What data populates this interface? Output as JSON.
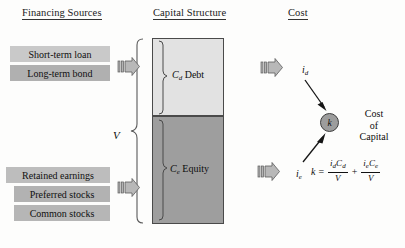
{
  "headers": {
    "financing": "Financing Sources",
    "capital": "Capital Structure",
    "cost": "Cost"
  },
  "financing_sources": {
    "debt_items": [
      {
        "label": "Short-term loan",
        "color": "#c9c9c9"
      },
      {
        "label": "Long-term bond",
        "color": "#b0b0b0"
      }
    ],
    "equity_items": [
      {
        "label": "Retained earnings",
        "color": "#bdbdbd"
      },
      {
        "label": "Preferred stocks",
        "color": "#b2b2b2"
      },
      {
        "label": "Common stocks",
        "color": "#b6b6b6"
      }
    ]
  },
  "capital_structure": {
    "total_label": "V",
    "segments": [
      {
        "name": "debt",
        "symbol": "C",
        "subscript": "d",
        "label": "Debt",
        "color": "#e2e2e2"
      },
      {
        "name": "equity",
        "symbol": "C",
        "subscript": "e",
        "label": "Equity",
        "color": "#9e9e9e"
      }
    ]
  },
  "cost": {
    "debt_rate": {
      "symbol": "i",
      "subscript": "d"
    },
    "equity_rate": {
      "symbol": "i",
      "subscript": "e"
    },
    "k_node": {
      "symbol": "k",
      "color": "#9d9d9d"
    },
    "k_caption_lines": [
      "Cost",
      "of",
      "Capital"
    ],
    "formula": {
      "lhs": "k",
      "equals": "=",
      "term1_num_rate": "i",
      "term1_num_rate_sub": "d",
      "term1_num_cap": "C",
      "term1_num_cap_sub": "d",
      "term1_den": "V",
      "operator": "+",
      "term2_num_rate": "i",
      "term2_num_rate_sub": "e",
      "term2_num_cap": "C",
      "term2_num_cap_sub": "e",
      "term2_den": "V",
      "plain": "k = (i_d C_d)/V + (i_e C_e)/V"
    }
  },
  "arrows": {
    "block_arrow_count": 3,
    "line_arrow_count": 2
  }
}
